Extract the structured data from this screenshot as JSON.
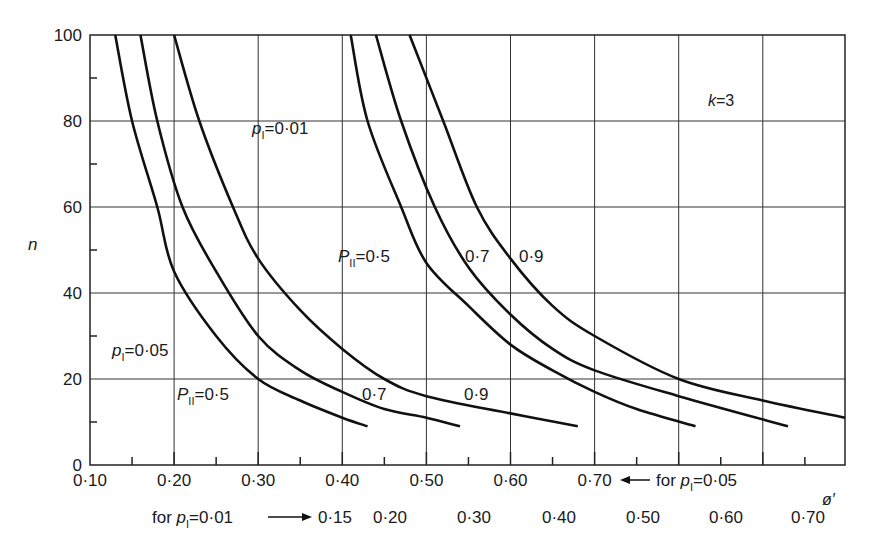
{
  "chart_data": {
    "type": "line",
    "title": "",
    "annotation_k": "k=3",
    "xlabel": "ø′",
    "ylabel": "n",
    "ylim": [
      0,
      100
    ],
    "xlim_primary": [
      0.1,
      0.8
    ],
    "grid": true,
    "y_ticks": [
      "0",
      "20",
      "40",
      "60",
      "80",
      "100"
    ],
    "x_ticks_primary": [
      "0·10",
      "0·20",
      "0·30",
      "0·40",
      "0·50",
      "0·60",
      "0·70"
    ],
    "x_primary_note": "← for p_I=0·05",
    "x_ticks_secondary": [
      "0·15",
      "0·20",
      "0·30",
      "0·40",
      "0·50",
      "0·60",
      "0·70"
    ],
    "x_secondary_note": "for p_I=0·01 →",
    "series": [
      {
        "name": "p_I=0.05, P_II=0.5",
        "x": [
          0.13,
          0.15,
          0.18,
          0.2,
          0.25,
          0.3,
          0.35,
          0.4,
          0.43
        ],
        "y": [
          100,
          80,
          60,
          45,
          30,
          20,
          15,
          11,
          9
        ]
      },
      {
        "name": "p_I=0.05, P_II=0.7",
        "x": [
          0.16,
          0.18,
          0.21,
          0.25,
          0.3,
          0.35,
          0.4,
          0.45,
          0.5,
          0.54
        ],
        "y": [
          100,
          80,
          60,
          45,
          30,
          22,
          17,
          13,
          11,
          9
        ]
      },
      {
        "name": "p_I=0.05, P_II=0.9",
        "x": [
          0.2,
          0.23,
          0.27,
          0.3,
          0.35,
          0.4,
          0.45,
          0.5,
          0.6,
          0.68
        ],
        "y": [
          100,
          80,
          60,
          48,
          36,
          27,
          20,
          16,
          12,
          9
        ]
      },
      {
        "name": "p_I=0.01, P_II=0.5",
        "x": [
          0.41,
          0.43,
          0.47,
          0.5,
          0.55,
          0.6,
          0.65,
          0.7,
          0.75,
          0.82
        ],
        "y": [
          100,
          80,
          60,
          47,
          37,
          28,
          22,
          17,
          13,
          9
        ]
      },
      {
        "name": "p_I=0.01, P_II=0.7",
        "x": [
          0.44,
          0.47,
          0.51,
          0.55,
          0.6,
          0.65,
          0.7,
          0.8,
          0.93
        ],
        "y": [
          100,
          80,
          60,
          46,
          35,
          27,
          22,
          16,
          9
        ]
      },
      {
        "name": "p_I=0.01, P_II=0.9",
        "x": [
          0.48,
          0.52,
          0.56,
          0.6,
          0.65,
          0.7,
          0.8,
          0.9,
          1.0
        ],
        "y": [
          100,
          80,
          60,
          48,
          37,
          30,
          20,
          15,
          11
        ]
      }
    ],
    "labels": {
      "p1_001": "=0·01",
      "p1_005": "=0·05",
      "pii_05": "=0·5",
      "v07": "0·7",
      "v09": "0·9"
    }
  }
}
